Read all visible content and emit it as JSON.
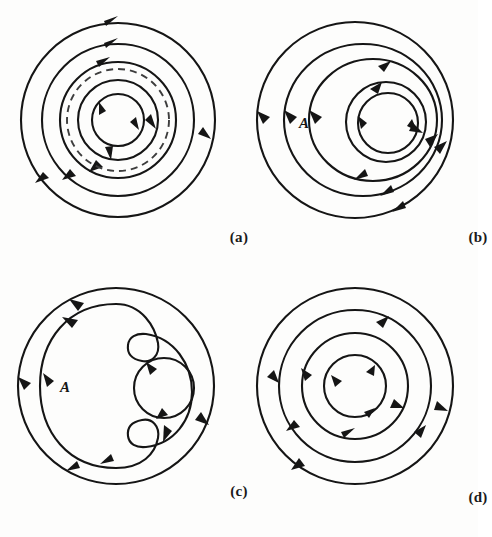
{
  "figure": {
    "background_color": "#fdfdfc",
    "line_color": "#151515",
    "dashed_color": "#3d3d3d",
    "panel_count": 4
  },
  "panels": [
    {
      "id": "a",
      "caption": "(a)",
      "description": "Concentric closed orbits, all clockwise, with one dashed limit-cycle circle",
      "center": {
        "x": 118,
        "y": 120
      },
      "orbit_direction": "clockwise",
      "curves": [
        {
          "name": "orbit-1-outer",
          "type": "circle",
          "r": 97,
          "style": "solid",
          "direction": "clockwise",
          "arrow_angles": [
            -90,
            20,
            150
          ]
        },
        {
          "name": "orbit-2",
          "type": "circle",
          "r": 76,
          "style": "solid",
          "direction": "clockwise",
          "arrow_angles": [
            -88,
            130
          ]
        },
        {
          "name": "orbit-3",
          "type": "circle",
          "r": 58,
          "style": "solid",
          "direction": "clockwise",
          "arrow_angles": [
            -75,
            95
          ]
        },
        {
          "name": "limit-cycle",
          "type": "circle",
          "r": 51,
          "style": "dashed",
          "direction": "clockwise",
          "arrow_angles": []
        },
        {
          "name": "orbit-4",
          "type": "circle",
          "r": 40,
          "style": "solid",
          "direction": "clockwise",
          "arrow_angles": [
            10,
            75
          ]
        },
        {
          "name": "orbit-5-inner",
          "type": "circle",
          "r": 26,
          "style": "solid",
          "direction": "clockwise",
          "arrow_angles": [
            -130,
            30
          ]
        }
      ],
      "labels": []
    },
    {
      "id": "b",
      "caption": "(b)",
      "description": "Nested non-concentric closed orbits, counterclockwise, region A marked at left",
      "center": {
        "x": 116,
        "y": 120
      },
      "orbit_direction": "counterclockwise",
      "curves": [
        {
          "name": "orbit-1-outer",
          "type": "circle",
          "r": 98,
          "style": "solid",
          "direction": "counterclockwise",
          "arrow_angles": [
            180,
            40,
            100
          ]
        },
        {
          "name": "orbit-2",
          "type": "oval",
          "rx": 79,
          "ry": 76,
          "cx_off": 6,
          "style": "solid",
          "direction": "counterclockwise",
          "arrow_angles": [
            180,
            -70,
            45
          ]
        },
        {
          "name": "orbit-3",
          "type": "oval",
          "rx": 62,
          "ry": 60,
          "cx_off": 14,
          "style": "solid",
          "direction": "counterclockwise",
          "arrow_angles": [
            180,
            -80,
            70
          ]
        },
        {
          "name": "orbit-4",
          "type": "circle",
          "r": 38,
          "cx_off": 30,
          "style": "solid",
          "direction": "counterclockwise",
          "arrow_angles": [
            -100,
            20
          ]
        },
        {
          "name": "orbit-5-inner",
          "type": "circle",
          "r": 29,
          "cx_off": 30,
          "style": "solid",
          "direction": "counterclockwise",
          "arrow_angles": [
            175,
            5
          ]
        }
      ],
      "labels": [
        {
          "name": "region-label-A",
          "text": "A",
          "x": 58,
          "y": 128
        }
      ]
    },
    {
      "id": "c",
      "caption": "(c)",
      "description": "Outer circle, crescent-shaped closed orbit wrapping a small circular orbit, region A marked",
      "center": {
        "x": 116,
        "y": 120
      },
      "orbit_direction": "counterclockwise",
      "curves": [
        {
          "name": "orbit-1-outer",
          "type": "circle",
          "r": 98,
          "style": "solid",
          "direction": "counterclockwise",
          "arrow_angles": [
            180,
            -125,
            30,
            100
          ]
        },
        {
          "name": "orbit-2-crescent",
          "type": "crescent",
          "style": "solid",
          "direction": "counterclockwise",
          "arrow_angles": [
            180,
            -130,
            110,
            40
          ]
        },
        {
          "name": "orbit-3-small",
          "type": "circle",
          "r": 30,
          "cx_off": 48,
          "cy_off": 2,
          "style": "solid",
          "direction": "counterclockwise",
          "arrow_angles": [
            -60,
            75
          ]
        }
      ],
      "labels": [
        {
          "name": "region-label-A",
          "text": "A",
          "x": 60,
          "y": 112
        }
      ]
    },
    {
      "id": "d",
      "caption": "(d)",
      "description": "Four concentric circular orbits, all clockwise",
      "center": {
        "x": 116,
        "y": 118
      },
      "orbit_direction": "clockwise",
      "curves": [
        {
          "name": "orbit-1-outer",
          "type": "circle",
          "r": 98,
          "style": "solid",
          "direction": "clockwise",
          "arrow_angles": [
            25,
            150,
            -120
          ]
        },
        {
          "name": "orbit-2",
          "type": "circle",
          "r": 76,
          "style": "solid",
          "direction": "clockwise",
          "arrow_angles": [
            -55,
            50,
            165
          ]
        },
        {
          "name": "orbit-3",
          "type": "circle",
          "r": 53,
          "style": "solid",
          "direction": "clockwise",
          "arrow_angles": [
            60,
            135,
            -145
          ]
        },
        {
          "name": "orbit-4-inner",
          "type": "circle",
          "r": 31,
          "style": "solid",
          "direction": "clockwise",
          "arrow_angles": [
            -70,
            55,
            175
          ]
        }
      ],
      "labels": []
    }
  ]
}
